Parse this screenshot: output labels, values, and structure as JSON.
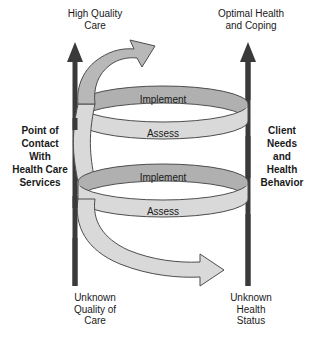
{
  "figure": {
    "captions": {
      "top_left": "High Quality\nCare",
      "top_right": "Optimal Health\nand Coping",
      "side_left": "Point of\nContact\nWith\nHealth Care\nServices",
      "side_right": "Client\nNeeds\nand\nHealth\nBehavior",
      "bottom_left": "Unknown\nQuality of\nCare",
      "bottom_right": "Unknown\nHealth\nStatus"
    },
    "spiral": {
      "loops": [
        {
          "back_label": "Implement",
          "front_label": "Assess"
        },
        {
          "back_label": "Implement",
          "front_label": "Assess"
        }
      ],
      "top_arrow_direction": "upper-right",
      "bottom_arrow_direction": "left"
    },
    "axes": [
      {
        "name": "left-axis",
        "direction": "up"
      },
      {
        "name": "right-axis",
        "direction": "up"
      }
    ],
    "colors": {
      "band_front": "#d9d9d9",
      "band_back": "#b0b0b0",
      "band_stroke": "#4d4d4d",
      "axis": "#3a3a3a",
      "text": "#1a1a1a",
      "background": "#ffffff"
    }
  }
}
